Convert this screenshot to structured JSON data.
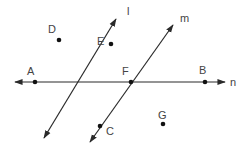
{
  "diagram": {
    "colors": {
      "line": "#2a2a2a",
      "point": "#111111",
      "label": "#444444",
      "background": "#ffffff"
    },
    "lines": [
      {
        "name": "l",
        "label": "l",
        "from": [
          116,
          19
        ],
        "to": [
          44,
          138
        ],
        "arrows": "both",
        "label_pos": [
          127,
          15
        ]
      },
      {
        "name": "m",
        "label": "m",
        "from": [
          173,
          25
        ],
        "to": [
          90,
          142
        ],
        "arrows": "both",
        "label_pos": [
          180,
          22
        ]
      },
      {
        "name": "n",
        "label": "n",
        "from": [
          15,
          82
        ],
        "to": [
          225,
          82
        ],
        "arrows": "both",
        "label_pos": [
          230,
          86
        ]
      }
    ],
    "points": [
      {
        "name": "A",
        "label": "A",
        "pos": [
          35,
          82
        ],
        "label_pos": [
          27,
          75
        ]
      },
      {
        "name": "B",
        "label": "B",
        "pos": [
          205,
          82
        ],
        "label_pos": [
          199,
          74
        ]
      },
      {
        "name": "C",
        "label": "C",
        "pos": [
          100,
          126
        ],
        "label_pos": [
          106,
          135
        ]
      },
      {
        "name": "D",
        "label": "D",
        "pos": [
          59,
          40
        ],
        "label_pos": [
          48,
          33
        ]
      },
      {
        "name": "E",
        "label": "E",
        "pos": [
          111,
          44
        ],
        "label_pos": [
          97,
          45
        ]
      },
      {
        "name": "F",
        "label": "F",
        "pos": [
          131,
          82
        ],
        "label_pos": [
          122,
          75
        ]
      },
      {
        "name": "G",
        "label": "G",
        "pos": [
          163,
          124
        ],
        "label_pos": [
          158,
          119
        ]
      }
    ]
  }
}
